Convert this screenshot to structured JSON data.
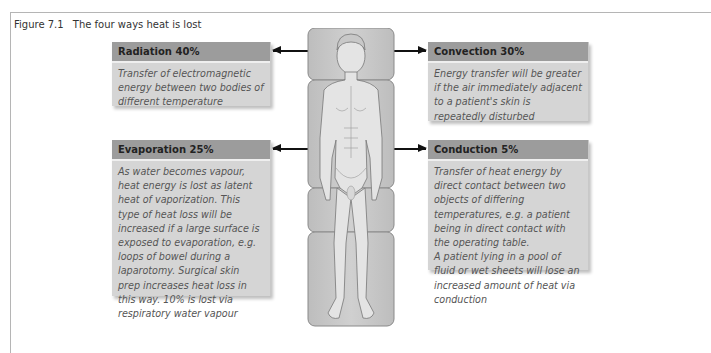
{
  "figure": {
    "number": "Figure 7.1",
    "title": "The four ways heat is lost"
  },
  "boxes": {
    "radiation": {
      "title": "Radiation 40%",
      "text": "Transfer of electromagnetic energy between two bodies of different temperature"
    },
    "convection": {
      "title": "Convection 30%",
      "text": "Energy transfer will be greater if the air immediately adjacent to a patient's skin is repeatedly disturbed"
    },
    "evaporation": {
      "title": "Evaporation 25%",
      "text": "As water becomes vapour, heat energy is lost as latent heat of vaporization. This type of heat loss will be increased if a large surface is exposed to evaporation, e.g. loops of bowel during a laparotomy. Surgical skin prep increases heat loss in this way. 10% is lost via respiratory water vapour"
    },
    "conduction": {
      "title": "Conduction 5%",
      "text1": "Transfer of heat energy by direct contact between two objects of differing temperatures, e.g. a patient being in direct contact with the operating table.",
      "text2": "A patient lying in a pool of fluid or wet sheets will lose an increased amount of heat via conduction"
    }
  },
  "colors": {
    "header": "#9c9c9c",
    "body": "#d5d5d5",
    "arrow": "#111111"
  },
  "illustration": "patient-on-operating-table"
}
